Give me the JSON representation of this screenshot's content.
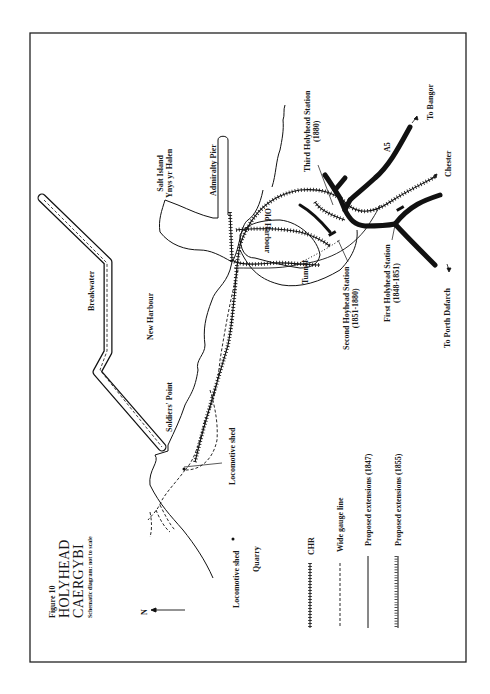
{
  "figure": {
    "number": "Figure 10",
    "title_line1": "HOLYHEAD",
    "title_line2": "CAERGYBI",
    "subtitle": "Schematic diagram: not to scale"
  },
  "north_arrow": {
    "label": "N",
    "icon": "north-arrow-icon"
  },
  "places": {
    "breakwater": "Breakwater",
    "new_harbour": "New Harbour",
    "salt_island": "Salt Island",
    "salt_island_welsh": "Ynys yr Halen",
    "admiralty_pier": "Admiralty Pier",
    "old_harbour": "Old Harbour",
    "tunnel": "Tunnel",
    "soldiers_point": "Soldiers' Point",
    "quarry": "Quarry",
    "road_a5": "A5"
  },
  "stations": {
    "third": {
      "name": "Third Holyhead Station",
      "years": "(1880)"
    },
    "second": {
      "name": "Second Hoyhead Station",
      "years": "(1851-1880)"
    },
    "first": {
      "name": "First Holyhead Station",
      "years": "(1848-1851)"
    }
  },
  "sheds": {
    "shed_1": "Locomotive shed",
    "shed_2": "Locomotive shed"
  },
  "destinations": {
    "bangor": "To Bangor",
    "chester": "Chester",
    "porth_dafarch": "To Porth Dafarch"
  },
  "legend": {
    "items": [
      {
        "label": "CHR",
        "symbol": "cross-hatched-line"
      },
      {
        "label": "Wide gauge line",
        "symbol": "dashed-line"
      },
      {
        "label": "Proposed extensions (1847)",
        "symbol": "solid-line"
      },
      {
        "label": "Proposed extensions (1855)",
        "symbol": "ticked-line"
      }
    ]
  },
  "colors": {
    "ink": "#111111",
    "paper": "#ffffff",
    "frame": "#222222"
  }
}
